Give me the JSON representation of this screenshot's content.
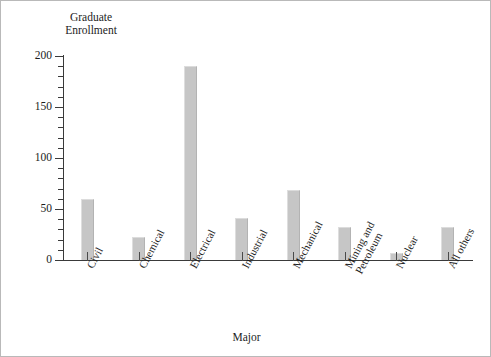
{
  "chart_data": {
    "type": "bar",
    "title": "",
    "xlabel": "Major",
    "ylabel": "Graduate\nEnrollment",
    "categories": [
      "Civil",
      "Chemical",
      "Electrical",
      "Industrial",
      "Mechanical",
      "Mining and\nPetroleum",
      "Nuclear",
      "All others"
    ],
    "values": [
      60,
      23,
      190,
      41,
      69,
      32,
      7,
      32
    ],
    "ylim": [
      0,
      200
    ],
    "ytick_labels": [
      "0",
      "50",
      "100",
      "150",
      "200"
    ],
    "ytick_values": [
      0,
      50,
      100,
      150,
      200
    ],
    "yminor_step": 10,
    "grid": false,
    "legend": null,
    "bar_color": "#c6c6c6",
    "axis_color": "#3a3a3a",
    "text_color": "#1c1c1c"
  }
}
